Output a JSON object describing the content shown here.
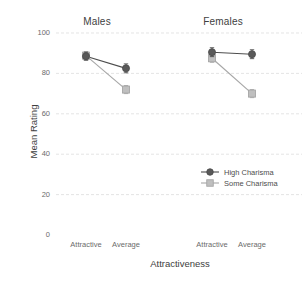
{
  "chart_data": {
    "type": "line",
    "title": "",
    "xlabel": "Attractiveness",
    "ylabel": "Mean Rating",
    "ylim": [
      0,
      100
    ],
    "yticks": [
      0,
      20,
      40,
      60,
      80,
      100
    ],
    "grid": "horizontal",
    "legend_position": "inside-right",
    "panels": [
      {
        "name": "Males",
        "categories": [
          "Attractive",
          "Average"
        ],
        "series": [
          {
            "name": "High Charisma",
            "values": [
              88.5,
              82.5
            ],
            "errors": [
              2.0,
              2.2
            ]
          },
          {
            "name": "Some Charisma",
            "values": [
              88.8,
              72.0
            ],
            "errors": [
              2.0,
              2.0
            ]
          }
        ]
      },
      {
        "name": "Females",
        "categories": [
          "Attractive",
          "Average"
        ],
        "series": [
          {
            "name": "High Charisma",
            "values": [
              90.5,
              89.5
            ],
            "errors": [
              2.2,
              2.2
            ]
          },
          {
            "name": "Some Charisma",
            "values": [
              87.5,
              70.0
            ],
            "errors": [
              2.0,
              2.0
            ]
          }
        ]
      }
    ],
    "series_style": [
      {
        "name": "High Charisma",
        "marker": "circle",
        "color": "#595959",
        "line_color": "#4d4d4d"
      },
      {
        "name": "Some Charisma",
        "marker": "square",
        "color": "#bfbfbf",
        "line_color": "#a6a6a6"
      }
    ]
  },
  "panels": {
    "males": "Males",
    "females": "Females"
  },
  "y_axis": {
    "title": "Mean Rating",
    "ticks": [
      "100",
      "80",
      "60",
      "40",
      "20",
      "0"
    ]
  },
  "x_axis": {
    "title": "Attractiveness",
    "ticks": [
      "Attractive",
      "Average",
      "Attractive",
      "Average"
    ]
  },
  "legend": {
    "items": [
      {
        "label": "High Charisma",
        "marker": "circle-marker-icon"
      },
      {
        "label": "Some Charisma",
        "marker": "square-marker-icon"
      }
    ]
  },
  "colors": {
    "high_charisma": "#595959",
    "some_charisma": "#bfbfbf",
    "grid": "#d9d9d9",
    "text": "#4d4d4d"
  }
}
